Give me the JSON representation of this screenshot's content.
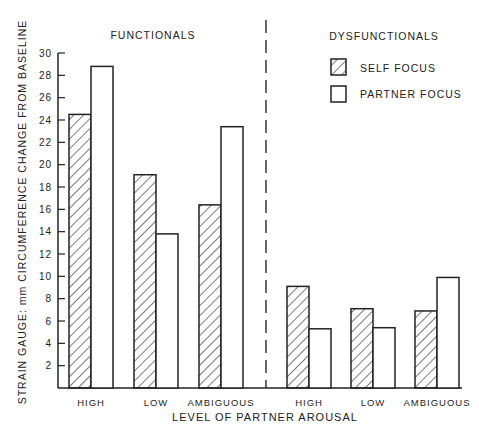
{
  "chart_data": {
    "type": "bar",
    "title": "",
    "ylabel": "STRAIN GAUGE: mm CIRCUMFERENCE CHANGE FROM BASELINE",
    "xlabel": "LEVEL OF PARTNER AROUSAL",
    "ylim": [
      0,
      30
    ],
    "yticks": [
      2,
      4,
      6,
      8,
      10,
      12,
      14,
      16,
      18,
      20,
      22,
      24,
      26,
      28,
      30
    ],
    "grid": false,
    "legend_position": "top-right",
    "groups": [
      {
        "name": "FUNCTIONALS",
        "categories": [
          "HIGH",
          "LOW",
          "AMBIGUOUS"
        ],
        "series": [
          {
            "name": "SELF FOCUS",
            "pattern": "hatched",
            "values": [
              24.5,
              19.1,
              16.4
            ]
          },
          {
            "name": "PARTNER FOCUS",
            "pattern": "open",
            "values": [
              28.8,
              13.8,
              23.4
            ]
          }
        ]
      },
      {
        "name": "DYSFUNCTIONALS",
        "categories": [
          "HIGH",
          "LOW",
          "AMBIGUOUS"
        ],
        "series": [
          {
            "name": "SELF FOCUS",
            "pattern": "hatched",
            "values": [
              9.1,
              7.1,
              6.9
            ]
          },
          {
            "name": "PARTNER FOCUS",
            "pattern": "open",
            "values": [
              5.3,
              5.4,
              9.9
            ]
          }
        ]
      }
    ]
  },
  "labels": {
    "functionals": "FUNCTIONALS",
    "dysfunctionals": "DYSFUNCTIONALS",
    "legend_self": "SELF FOCUS",
    "legend_partner": "PARTNER FOCUS",
    "xlabel": "LEVEL OF PARTNER AROUSAL",
    "ylabel": "STRAIN GAUGE: mm CIRCUMFERENCE CHANGE FROM BASELINE"
  }
}
